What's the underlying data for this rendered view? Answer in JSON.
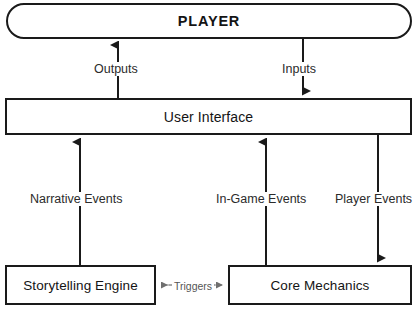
{
  "diagram": {
    "background_color": "#ffffff",
    "line_color": "#1a1a1a",
    "muted_line_color": "#8a8a8a",
    "nodes": {
      "player": {
        "label": "PLAYER",
        "shape": "stadium"
      },
      "user_interface": {
        "label": "User Interface",
        "shape": "rectangle"
      },
      "storytelling_engine": {
        "label": "Storytelling Engine",
        "shape": "rectangle"
      },
      "core_mechanics": {
        "label": "Core Mechanics",
        "shape": "rectangle"
      }
    },
    "edges": {
      "outputs": {
        "label": "Outputs",
        "from": "user_interface",
        "to": "player",
        "direction": "up"
      },
      "inputs": {
        "label": "Inputs",
        "from": "player",
        "to": "user_interface",
        "direction": "down"
      },
      "narrative_events": {
        "label": "Narrative Events",
        "from": "storytelling_engine",
        "to": "user_interface",
        "direction": "up"
      },
      "ingame_events": {
        "label": "In-Game Events",
        "from": "core_mechanics",
        "to": "user_interface",
        "direction": "up"
      },
      "player_events": {
        "label": "Player Events",
        "from": "user_interface",
        "to": "core_mechanics",
        "direction": "down"
      },
      "triggers": {
        "label": "Triggers",
        "from": "storytelling_engine",
        "to": "core_mechanics",
        "direction": "bidirectional"
      }
    }
  }
}
